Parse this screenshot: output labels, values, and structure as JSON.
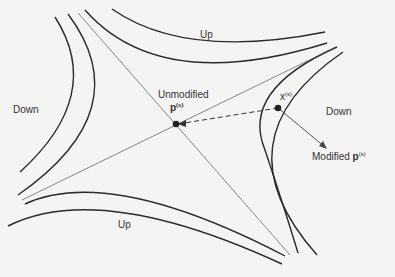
{
  "diagram": {
    "regions": {
      "up_top": "Up",
      "up_bottom": "Up",
      "down_left": "Down",
      "down_right": "Down"
    },
    "points": {
      "unmodified_label": "Unmodified",
      "p_symbol": "p",
      "p_superscript": "(s)",
      "x_symbol": "x",
      "x_superscript": "(s)",
      "modified_label": "Modified",
      "modified_p_symbol": "p",
      "modified_p_superscript": "(s)"
    },
    "colors": {
      "curve": "#2a2a2a",
      "background": "#f4f4f2"
    }
  }
}
